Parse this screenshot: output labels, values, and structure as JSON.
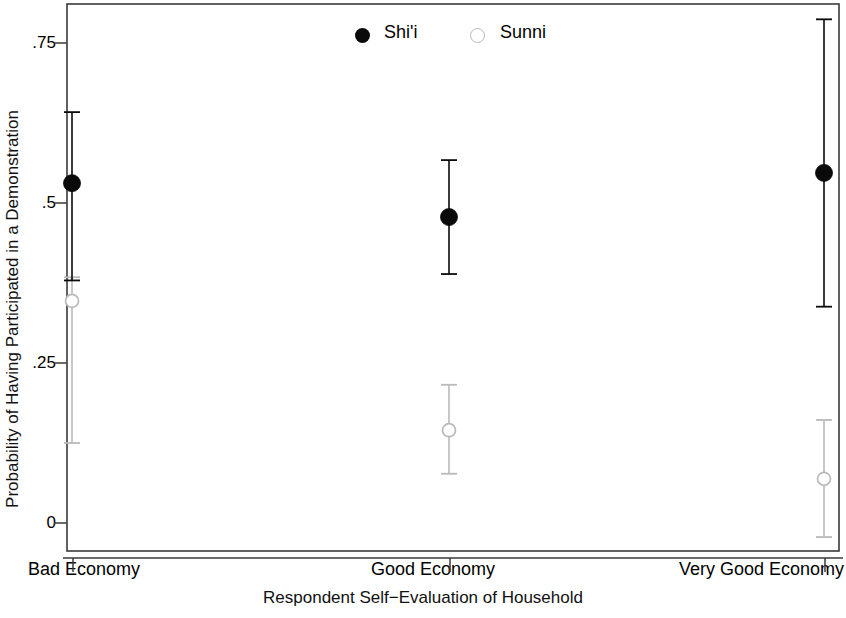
{
  "chart_data": {
    "type": "scatter",
    "title": "",
    "xlabel": "Respondent Self−Evaluation of Household",
    "ylabel": "Probability of Having Participated in a Demonstration",
    "categories": [
      "Bad Economy",
      "Good Economy",
      "Very Good Economy"
    ],
    "yticks": [
      "0",
      ".25",
      ".5",
      ".75"
    ],
    "ytick_values": [
      0,
      0.25,
      0.5,
      0.75
    ],
    "ylim": [
      -0.045,
      0.81
    ],
    "grid": false,
    "legend_position": "top-center",
    "series": [
      {
        "name": "Shi'i",
        "marker": "filled-circle",
        "color": "#0a0a0a",
        "values": [
          0.531,
          0.478,
          0.547
        ],
        "ci_low": [
          0.379,
          0.389,
          0.338
        ],
        "ci_high": [
          0.642,
          0.567,
          0.787
        ]
      },
      {
        "name": "Sunni",
        "marker": "open-circle",
        "color": "#b9b9b9",
        "values": [
          0.347,
          0.145,
          0.069
        ],
        "ci_low": [
          0.125,
          0.077,
          -0.022
        ],
        "ci_high": [
          0.384,
          0.216,
          0.161
        ]
      }
    ]
  },
  "legend": {
    "entries": [
      {
        "label": "Shi'i",
        "marker": "filled-circle"
      },
      {
        "label": "Sunni",
        "marker": "open-circle"
      }
    ]
  },
  "axes": {
    "y_title": "Probability of Having Participated in a Demonstration",
    "x_title": "Respondent Self−Evaluation of Household",
    "y_tick_labels": [
      "0",
      ".25",
      ".5",
      ".75"
    ],
    "x_tick_labels": [
      "Bad Economy",
      "Good Economy",
      "Very Good Economy"
    ]
  }
}
